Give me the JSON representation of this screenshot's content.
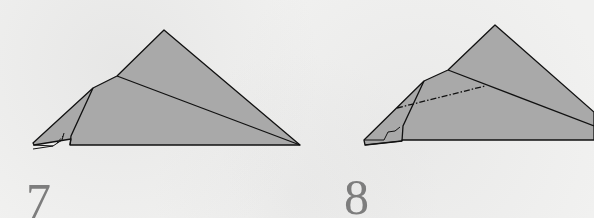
{
  "colors": {
    "background": "#f1f1f0",
    "paper_fill": "#a9a9a9",
    "line": "#111111",
    "step_number": "#7d7d7d"
  },
  "steps": [
    {
      "number": "7",
      "line_style": "solid"
    },
    {
      "number": "8",
      "line_style": "dash-dot",
      "annotation": "mountain-fold-line"
    }
  ]
}
